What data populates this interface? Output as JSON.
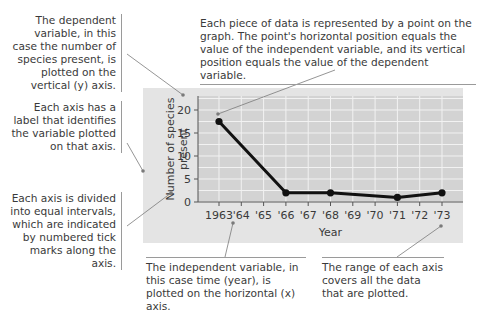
{
  "annotations": {
    "dependent_variable": "The dependent variable, in this case the number of species present, is plotted on the vertical (y) axis.",
    "axis_label": "Each axis has a label that identifies the variable plotted on that axis.",
    "intervals": "Each axis is divided into equal intervals, which are indicated by numbered tick marks along the axis.",
    "data_point": "Each piece of data is represented by a point on the graph. The point's horizontal position equals the value of the independent variable, and its vertical position equals the value of the dependent variable.",
    "independent_variable": "The independent variable, in this case time (year), is plotted on the horizontal (x) axis.",
    "range": "The range of each axis covers all the data that are plotted."
  },
  "chart_data": {
    "type": "line",
    "title": "",
    "xlabel": "Year",
    "ylabel": "Number of species present",
    "x_tick_labels": [
      "1963",
      "'64",
      "'65",
      "'66",
      "'67",
      "'68",
      "'69",
      "'70",
      "'71",
      "'72",
      "'73"
    ],
    "y_tick_labels": [
      "0",
      "5",
      "10",
      "15",
      "20"
    ],
    "xlim": [
      1963,
      1973
    ],
    "ylim": [
      0,
      23
    ],
    "grid": true,
    "legend": "none",
    "series": [
      {
        "name": "Number of species present",
        "x": [
          1963,
          1966,
          1968,
          1971,
          1973
        ],
        "values": [
          17.5,
          2,
          2,
          1,
          2
        ]
      }
    ]
  },
  "colors": {
    "panel_bg": "#e4e4e4",
    "plot_bg": "#d3d3d3",
    "grid": "#f2f2f2",
    "line": "#111111",
    "leader": "#7a7a7a"
  }
}
